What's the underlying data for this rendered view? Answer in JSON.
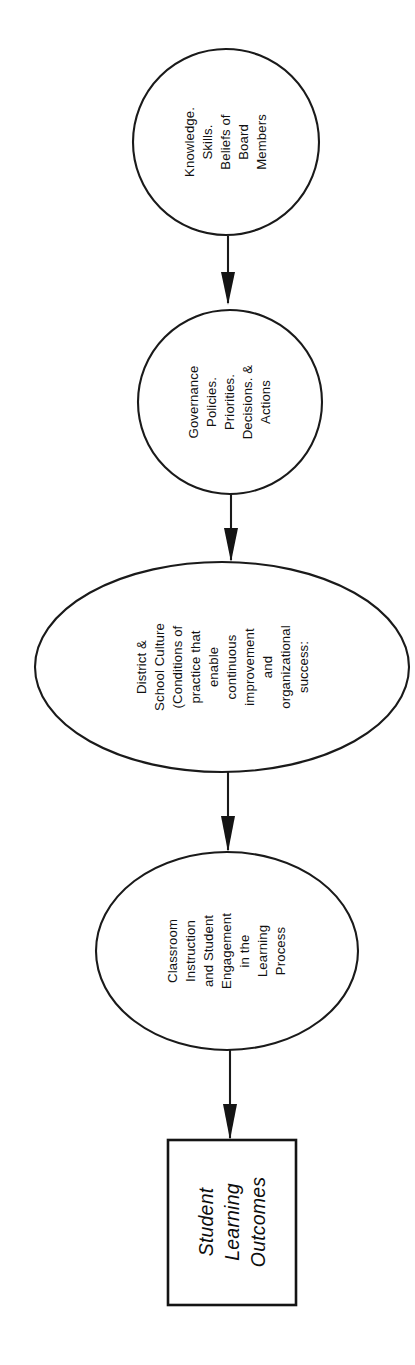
{
  "diagram": {
    "orientation": "vertical-flow-rotated-text",
    "text_rotation_degrees": -90,
    "colors": {
      "background": "#ffffff",
      "stroke": "#1a1a1a",
      "text": "#111111",
      "arrow_fill": "#141414"
    },
    "nodes": [
      {
        "id": "node-knowledge-skills-beliefs",
        "shape": "circle",
        "lines": [
          "Knowledge.",
          "Skills.",
          "Beliefs of",
          "Board",
          "Members"
        ]
      },
      {
        "id": "node-governance",
        "shape": "circle",
        "lines": [
          "Governance",
          "Policies.",
          "Priorities.",
          "Decisions. &",
          "Actions"
        ]
      },
      {
        "id": "node-district-school-culture",
        "shape": "ellipse",
        "lines": [
          "District &",
          "School Culture",
          "(Conditions of",
          "practice that",
          "enable",
          "continuous",
          "improvement",
          "and",
          "organizational",
          "success:"
        ]
      },
      {
        "id": "node-classroom-instruction",
        "shape": "ellipse",
        "lines": [
          "Classroom",
          "Instruction",
          "and Student",
          "Engagement",
          "in the",
          "Learning",
          "Process"
        ]
      },
      {
        "id": "node-student-learning-outcomes",
        "shape": "rectangle",
        "style": "italic",
        "lines": [
          "Student",
          "Learning",
          "Outcomes"
        ]
      }
    ],
    "connectors": [
      {
        "id": "connector-1",
        "from": "node-knowledge-skills-beliefs",
        "to": "node-governance",
        "arrow": "down"
      },
      {
        "id": "connector-2",
        "from": "node-governance",
        "to": "node-district-school-culture",
        "arrow": "down"
      },
      {
        "id": "connector-3",
        "from": "node-district-school-culture",
        "to": "node-classroom-instruction",
        "arrow": "down"
      },
      {
        "id": "connector-4",
        "from": "node-classroom-instruction",
        "to": "node-student-learning-outcomes",
        "arrow": "down"
      }
    ]
  }
}
